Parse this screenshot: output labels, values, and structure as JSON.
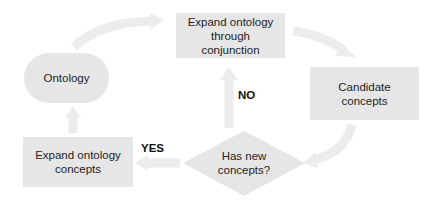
{
  "diagram": {
    "type": "flowchart",
    "nodes": {
      "ontology": "Ontology",
      "expand_conjunction": {
        "line1": "Expand ontology",
        "line2": "through",
        "line3": "conjunction"
      },
      "candidate": {
        "line1": "Candidate",
        "line2": "concepts"
      },
      "decision": {
        "line1": "Has new",
        "line2": "concepts?"
      },
      "expand_concepts": {
        "line1": "Expand ontology",
        "line2": "concepts"
      }
    },
    "edge_labels": {
      "no": "NO",
      "yes": "YES"
    },
    "edges": [
      {
        "from": "Ontology",
        "to": "Expand ontology through conjunction"
      },
      {
        "from": "Expand ontology through conjunction",
        "to": "Candidate concepts"
      },
      {
        "from": "Candidate concepts",
        "to": "Has new concepts?"
      },
      {
        "from": "Has new concepts?",
        "to": "Expand ontology through conjunction",
        "label": "NO"
      },
      {
        "from": "Has new concepts?",
        "to": "Expand ontology concepts",
        "label": "YES"
      },
      {
        "from": "Expand ontology concepts",
        "to": "Ontology"
      }
    ],
    "colors": {
      "node_fill": "#e6e6e6",
      "arrow_fill": "#ececec",
      "text": "#1e1e1e"
    }
  }
}
